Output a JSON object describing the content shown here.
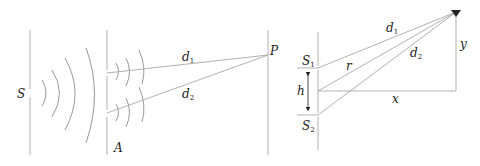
{
  "figure": {
    "left_panel": {
      "name": "Double-slit wave propagation",
      "labels": {
        "source": "S",
        "aperture": "A",
        "point": "P",
        "d1": "d",
        "d1_sub": "1",
        "d2": "d",
        "d2_sub": "2"
      }
    },
    "right_panel": {
      "name": "Path-difference geometry",
      "labels": {
        "s1": "S",
        "s1_sub": "1",
        "s2": "S",
        "s2_sub": "2",
        "h": "h",
        "r": "r",
        "x": "x",
        "y": "y",
        "d1": "d",
        "d1_sub": "1",
        "d2": "d",
        "d2_sub": "2"
      }
    },
    "colors": {
      "line": "#a8a8a8",
      "wave": "#8c8c8c",
      "text": "#222222"
    }
  }
}
